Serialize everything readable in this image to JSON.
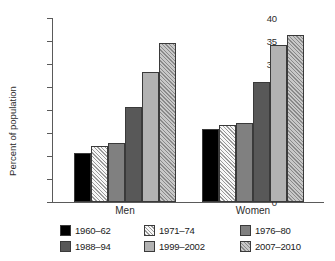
{
  "chart_data": {
    "type": "bar",
    "title": "",
    "xlabel": "",
    "ylabel": "Percent of population",
    "ylim": [
      0,
      40
    ],
    "yticks": [
      0,
      5,
      10,
      15,
      20,
      25,
      30,
      35,
      40
    ],
    "ytick_labels": [
      "0",
      "5",
      "10",
      "15",
      "20",
      "25",
      "30",
      "35",
      "40"
    ],
    "grid": false,
    "legend_position": "bottom",
    "categories": [
      "Men",
      "Women"
    ],
    "series": [
      {
        "name": "1960–62",
        "values": [
          10.7,
          15.8
        ],
        "color": "#000000",
        "pattern": "solid"
      },
      {
        "name": "1971–74",
        "values": [
          12.2,
          16.8
        ],
        "color": "#f2f2f2",
        "pattern": "diagonal-hatch"
      },
      {
        "name": "1976–80",
        "values": [
          12.8,
          17.1
        ],
        "color": "#808080",
        "pattern": "solid"
      },
      {
        "name": "1988–94",
        "values": [
          20.6,
          26.1
        ],
        "color": "#585858",
        "pattern": "solid"
      },
      {
        "name": "1999–2002",
        "values": [
          28.2,
          34.2
        ],
        "color": "#b2b2b2",
        "pattern": "solid"
      },
      {
        "name": "2007–2010",
        "values": [
          34.5,
          36.4
        ],
        "color": "#b4b4b4",
        "pattern": "diagonal-hatch"
      }
    ]
  },
  "legend": {
    "items": [
      {
        "label": "1960–62"
      },
      {
        "label": "1971–74"
      },
      {
        "label": "1976–80"
      },
      {
        "label": "1988–94"
      },
      {
        "label": "1999–2002"
      },
      {
        "label": "2007–2010"
      }
    ]
  }
}
